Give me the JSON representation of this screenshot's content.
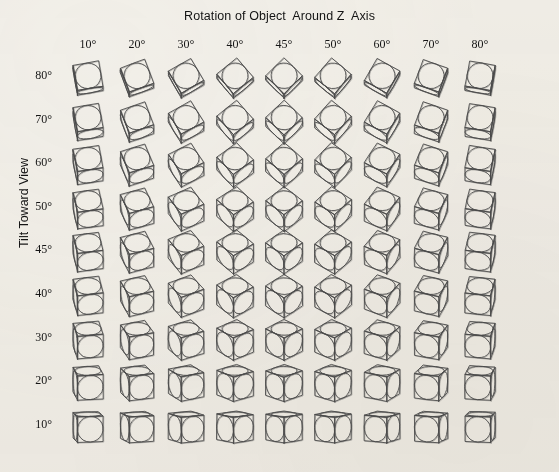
{
  "figure": {
    "title": "Rotation of Object  Around Z  Axis",
    "y_axis_title": "Tilt Toward View",
    "background_color": "#f3f1ec",
    "ink_color": "#4a4a4a"
  },
  "columns": {
    "header_label": "Rotation of Object  Around Z  Axis",
    "labels": [
      "10°",
      "20°",
      "30°",
      "40°",
      "45°",
      "50°",
      "60°",
      "70°",
      "80°"
    ],
    "values": [
      10,
      20,
      30,
      40,
      45,
      50,
      60,
      70,
      80
    ],
    "x_positions": [
      88,
      137,
      186,
      235,
      284,
      333,
      382,
      431,
      480
    ]
  },
  "rows": {
    "header_label": "Tilt Toward View",
    "labels": [
      "80°",
      "70°",
      "60°",
      "50°",
      "45°",
      "40°",
      "30°",
      "20°",
      "10°"
    ],
    "values": [
      80,
      70,
      60,
      50,
      45,
      40,
      30,
      20,
      10
    ],
    "y_positions": [
      76,
      120,
      163,
      207,
      250,
      294,
      338,
      381,
      425
    ]
  },
  "chart_data": {
    "type": "table",
    "title": "Rotation of Object  Around Z  Axis",
    "xlabel": "Rotation of Object  Around Z  Axis",
    "ylabel": "Tilt Toward View",
    "grid": false,
    "legend": "none",
    "cell_content": "line-drawn cube with an inscribed circle on each face",
    "x": [
      10,
      20,
      30,
      40,
      45,
      50,
      60,
      70,
      80
    ],
    "y": [
      80,
      70,
      60,
      50,
      45,
      40,
      30,
      20,
      10
    ],
    "xtick_labels": [
      "10°",
      "20°",
      "30°",
      "40°",
      "45°",
      "50°",
      "60°",
      "70°",
      "80°"
    ],
    "ytick_labels": [
      "80°",
      "70°",
      "60°",
      "50°",
      "45°",
      "40°",
      "30°",
      "20°",
      "10°"
    ],
    "series": [
      {
        "name": "tilt 80°",
        "tilt": 80,
        "rotations": [
          10,
          20,
          30,
          40,
          45,
          50,
          60,
          70,
          80
        ]
      },
      {
        "name": "tilt 70°",
        "tilt": 70,
        "rotations": [
          10,
          20,
          30,
          40,
          45,
          50,
          60,
          70,
          80
        ]
      },
      {
        "name": "tilt 60°",
        "tilt": 60,
        "rotations": [
          10,
          20,
          30,
          40,
          45,
          50,
          60,
          70,
          80
        ]
      },
      {
        "name": "tilt 50°",
        "tilt": 50,
        "rotations": [
          10,
          20,
          30,
          40,
          45,
          50,
          60,
          70,
          80
        ]
      },
      {
        "name": "tilt 45°",
        "tilt": 45,
        "rotations": [
          10,
          20,
          30,
          40,
          45,
          50,
          60,
          70,
          80
        ]
      },
      {
        "name": "tilt 40°",
        "tilt": 40,
        "rotations": [
          10,
          20,
          30,
          40,
          45,
          50,
          60,
          70,
          80
        ]
      },
      {
        "name": "tilt 30°",
        "tilt": 30,
        "rotations": [
          10,
          20,
          30,
          40,
          45,
          50,
          60,
          70,
          80
        ]
      },
      {
        "name": "tilt 20°",
        "tilt": 20,
        "rotations": [
          10,
          20,
          30,
          40,
          45,
          50,
          60,
          70,
          80
        ]
      },
      {
        "name": "tilt 10°",
        "tilt": 10,
        "rotations": [
          10,
          20,
          30,
          40,
          45,
          50,
          60,
          70,
          80
        ]
      }
    ]
  }
}
